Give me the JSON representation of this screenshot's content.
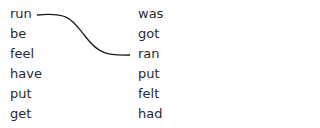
{
  "exercise": {
    "left_column": [
      "run",
      "be",
      "feel",
      "have",
      "put",
      "get"
    ],
    "right_column": [
      "was",
      "got",
      "ran",
      "put",
      "felt",
      "had"
    ],
    "matches": [
      {
        "from": "run",
        "to": "ran"
      }
    ]
  },
  "colors": {
    "text": "#2a2a2a",
    "line": "#1a1a1a",
    "background": "#ffffff"
  }
}
